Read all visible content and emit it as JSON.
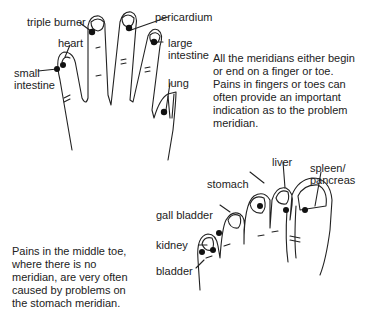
{
  "hand": {
    "labels": {
      "triple_burner": "triple burner",
      "heart": "heart",
      "pericardium": "pericardium",
      "large_intestine_1": "large",
      "large_intestine_2": "intestine",
      "small_intestine_1": "small",
      "small_intestine_2": "intestine",
      "lung": "lung"
    }
  },
  "foot": {
    "labels": {
      "liver": "liver",
      "spleen_1": "spleen/",
      "spleen_2": "pancreas",
      "stomach": "stomach",
      "gall_bladder": "gall bladder",
      "kidney": "kidney",
      "bladder": "bladder"
    }
  },
  "text": {
    "meridians_para": "All the meridians either begin or end on a finger or toe. Pains in fingers or toes can often provide an important indication as to the problem meridian.",
    "middle_toe_para": "Pains in the middle toe, where there is no meridian, are very often caused by problems on the stomach meridian."
  },
  "colors": {
    "line": "#222222",
    "dot": "#111111"
  }
}
